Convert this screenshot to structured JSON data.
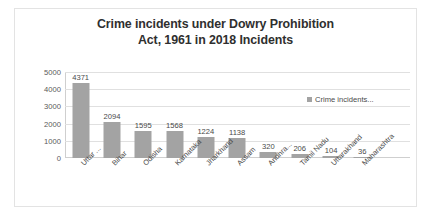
{
  "chart_data": {
    "type": "bar",
    "title": "Crime incidents under Dowry Prohibition Act, 1961 in 2018 Incidents",
    "title_lines": [
      "Crime incidents under Dowry Prohibition",
      "Act, 1961 in 2018 Incidents"
    ],
    "categories": [
      "Uttar ...",
      "Bihar",
      "Odisha",
      "Karnataka",
      "Jharkhand",
      "Assam",
      "Andhra...",
      "Tamil Nadu",
      "Uttarakhand",
      "Maharashtra"
    ],
    "values": [
      4371,
      2094,
      1595,
      1568,
      1224,
      1138,
      320,
      206,
      104,
      36
    ],
    "series": [
      {
        "name": "Crime incidents...",
        "values": [
          4371,
          2094,
          1595,
          1568,
          1224,
          1138,
          320,
          206,
          104,
          36
        ]
      }
    ],
    "xlabel": "",
    "ylabel": "",
    "ylim": [
      0,
      5000
    ],
    "yticks": [
      0,
      1000,
      2000,
      3000,
      4000,
      5000
    ],
    "ytick_labels": [
      "0",
      "1000",
      "2000",
      "3000",
      "4000",
      "5000"
    ],
    "grid": true,
    "legend": {
      "position": "top-right",
      "entries": [
        "Crime incidents..."
      ]
    },
    "data_labels": [
      "4371",
      "2094",
      "1595",
      "1568",
      "1224",
      "1138",
      "320",
      "206",
      "104",
      "36"
    ],
    "colors": {
      "bar": "#a3a3a3",
      "gridline": "#e0e0e0",
      "axis": "#cfcfcf",
      "title_text": "#2f2f2f",
      "label_text": "#4a4a4a",
      "plot_background": "#ffffff",
      "card_border": "#e3e3e3"
    }
  }
}
